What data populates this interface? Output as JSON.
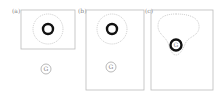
{
  "figure": {
    "panels": [
      {
        "label": "(a)",
        "goal_label": "G"
      },
      {
        "label": "(b)",
        "goal_label": "G"
      },
      {
        "label": "(c)",
        "goal_label": "G"
      }
    ]
  },
  "colors": {
    "frame": "#bbbbbb",
    "dotted": "#aaaaaa",
    "ring": "#111111",
    "goal": "#999999"
  }
}
